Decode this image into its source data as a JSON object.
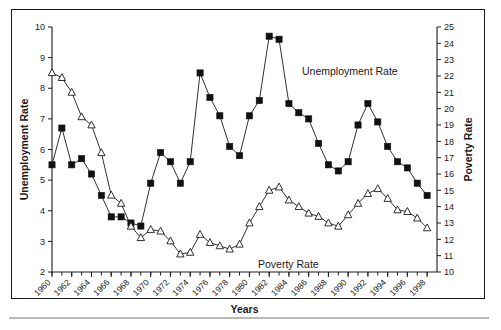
{
  "chart_data": {
    "type": "line",
    "title": "",
    "xlabel": "Years",
    "ylabel": "Unemployment Rate",
    "y2label": "Poverty Rate",
    "grid": false,
    "legend_position": "inline-annotations",
    "xlim": [
      1960,
      1999
    ],
    "ylim": [
      2,
      10
    ],
    "y2lim": [
      10,
      25
    ],
    "x_tick_labels": [
      "1960",
      "1962",
      "1964",
      "1966",
      "1968",
      "1970",
      "1972",
      "1974",
      "1976",
      "1978",
      "1980",
      "1982",
      "1984",
      "1986",
      "1988",
      "1990",
      "1992",
      "1994",
      "1996",
      "1998"
    ],
    "x_tick_values": [
      1960,
      1962,
      1964,
      1966,
      1968,
      1970,
      1972,
      1974,
      1976,
      1978,
      1980,
      1982,
      1984,
      1986,
      1988,
      1990,
      1992,
      1994,
      1996,
      1998
    ],
    "y_tick_labels": [
      "2",
      "3",
      "4",
      "5",
      "6",
      "7",
      "8",
      "9",
      "10"
    ],
    "y_tick_values": [
      2,
      3,
      4,
      5,
      6,
      7,
      8,
      9,
      10
    ],
    "y2_tick_labels": [
      "10",
      "11",
      "12",
      "13",
      "14",
      "15",
      "16",
      "17",
      "18",
      "19",
      "20",
      "21",
      "22",
      "23",
      "24",
      "25"
    ],
    "y2_tick_values": [
      10,
      11,
      12,
      13,
      14,
      15,
      16,
      17,
      18,
      19,
      20,
      21,
      22,
      23,
      24,
      25
    ],
    "x": [
      1960,
      1961,
      1962,
      1963,
      1964,
      1965,
      1966,
      1967,
      1968,
      1969,
      1970,
      1971,
      1972,
      1973,
      1974,
      1975,
      1976,
      1977,
      1978,
      1979,
      1980,
      1981,
      1982,
      1983,
      1984,
      1985,
      1986,
      1987,
      1988,
      1989,
      1990,
      1991,
      1992,
      1993,
      1994,
      1995,
      1996,
      1997,
      1998
    ],
    "series": [
      {
        "name": "Unemployment Rate",
        "axis": "left",
        "marker": "filled-square",
        "values": [
          5.5,
          6.7,
          5.5,
          5.7,
          5.2,
          4.5,
          3.8,
          3.8,
          3.6,
          3.5,
          4.9,
          5.9,
          5.6,
          4.9,
          5.6,
          8.5,
          7.7,
          7.1,
          6.1,
          5.8,
          7.1,
          7.6,
          9.7,
          9.6,
          7.5,
          7.2,
          7.0,
          6.2,
          5.5,
          5.3,
          5.6,
          6.8,
          7.5,
          6.9,
          6.1,
          5.6,
          5.4,
          4.9,
          4.5
        ]
      },
      {
        "name": "Poverty Rate",
        "axis": "right",
        "marker": "open-triangle",
        "values": [
          22.2,
          21.9,
          21.0,
          19.5,
          19.0,
          17.3,
          14.7,
          14.2,
          12.8,
          12.1,
          12.6,
          12.5,
          11.9,
          11.1,
          11.2,
          12.3,
          11.8,
          11.6,
          11.4,
          11.7,
          13.0,
          14.0,
          15.0,
          15.2,
          14.4,
          14.0,
          13.6,
          13.4,
          13.0,
          12.8,
          13.5,
          14.2,
          14.8,
          15.1,
          14.5,
          13.8,
          13.7,
          13.3,
          12.7
        ]
      }
    ],
    "annotations": [
      {
        "text": "Unemployment Rate",
        "series": "Unemployment Rate"
      },
      {
        "text": "Poverty Rate",
        "series": "Poverty Rate"
      }
    ]
  }
}
